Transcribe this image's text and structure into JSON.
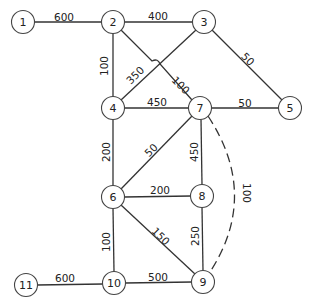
{
  "graph": {
    "nodes": [
      {
        "id": "1",
        "x": 23,
        "y": 22
      },
      {
        "id": "2",
        "x": 113,
        "y": 22
      },
      {
        "id": "3",
        "x": 204,
        "y": 22
      },
      {
        "id": "4",
        "x": 113,
        "y": 108
      },
      {
        "id": "5",
        "x": 290,
        "y": 108
      },
      {
        "id": "6",
        "x": 113,
        "y": 197
      },
      {
        "id": "7",
        "x": 200,
        "y": 108
      },
      {
        "id": "8",
        "x": 202,
        "y": 196
      },
      {
        "id": "9",
        "x": 203,
        "y": 282
      },
      {
        "id": "10",
        "x": 114,
        "y": 283
      },
      {
        "id": "11",
        "x": 26,
        "y": 285
      }
    ],
    "edges": [
      {
        "from": "1",
        "to": "2",
        "weight": "600",
        "lx": 64,
        "ly": 17,
        "rot": 0
      },
      {
        "from": "2",
        "to": "3",
        "weight": "400",
        "lx": 158,
        "ly": 16,
        "rot": 0
      },
      {
        "from": "2",
        "to": "4",
        "weight": "100",
        "lx": 104,
        "ly": 66,
        "rot": -90
      },
      {
        "from": "2",
        "to": "7",
        "weight": "100",
        "lx": 181,
        "ly": 85,
        "rot": 45
      },
      {
        "from": "3",
        "to": "4",
        "weight": "350",
        "lx": 134,
        "ly": 75,
        "rot": -45
      },
      {
        "from": "3",
        "to": "5",
        "weight": "50",
        "lx": 248,
        "ly": 59,
        "rot": 45
      },
      {
        "from": "4",
        "to": "7",
        "weight": "450",
        "lx": 157,
        "ly": 102,
        "rot": 0
      },
      {
        "from": "7",
        "to": "5",
        "weight": "50",
        "lx": 245,
        "ly": 103,
        "rot": 0
      },
      {
        "from": "4",
        "to": "6",
        "weight": "200",
        "lx": 106,
        "ly": 152,
        "rot": -90
      },
      {
        "from": "7",
        "to": "6",
        "weight": "50",
        "lx": 152,
        "ly": 149,
        "rot": -45
      },
      {
        "from": "7",
        "to": "8",
        "weight": "450",
        "lx": 194,
        "ly": 152,
        "rot": -90
      },
      {
        "from": "7",
        "to": "9",
        "weight": "100",
        "lx": 246,
        "ly": 192,
        "rot": 90,
        "dashed": true
      },
      {
        "from": "6",
        "to": "8",
        "weight": "200",
        "lx": 160,
        "ly": 190,
        "rot": 0
      },
      {
        "from": "6",
        "to": "9",
        "weight": "150",
        "lx": 162,
        "ly": 236,
        "rot": 45
      },
      {
        "from": "8",
        "to": "9",
        "weight": "250",
        "lx": 195,
        "ly": 236,
        "rot": -90
      },
      {
        "from": "6",
        "to": "10",
        "weight": "100",
        "lx": 106,
        "ly": 242,
        "rot": -90
      },
      {
        "from": "11",
        "to": "10",
        "weight": "600",
        "lx": 65,
        "ly": 278,
        "rot": 0
      },
      {
        "from": "10",
        "to": "9",
        "weight": "500",
        "lx": 158,
        "ly": 277,
        "rot": 0
      }
    ]
  }
}
